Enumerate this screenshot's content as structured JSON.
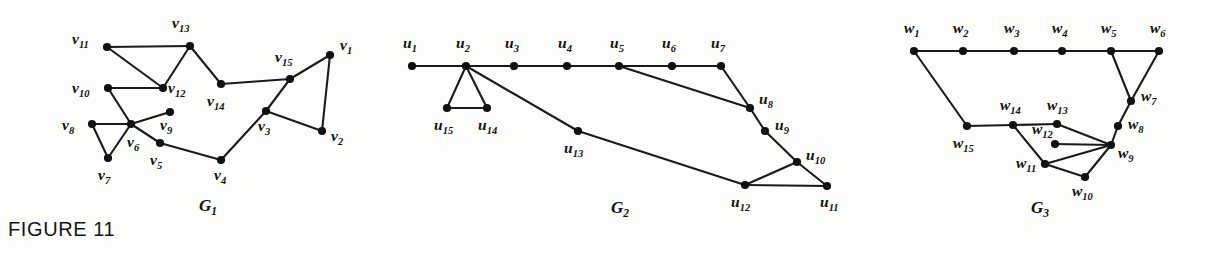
{
  "figure": {
    "caption": "FIGURE 11",
    "background_color": "#fdfdfc",
    "ink_color": "#111111"
  },
  "graphs": [
    {
      "id": "G1",
      "caption_base": "G",
      "caption_sub": "1",
      "caption_x": 208,
      "caption_y": 211,
      "vertex_prefix": "v",
      "vertices": [
        {
          "id": "v1",
          "base": "v",
          "sub": "1",
          "x": 330,
          "y": 55,
          "label_x": 340,
          "label_y": 50
        },
        {
          "id": "v2",
          "base": "v",
          "sub": "2",
          "x": 322,
          "y": 131,
          "label_x": 331,
          "label_y": 141
        },
        {
          "id": "v3",
          "base": "v",
          "sub": "3",
          "x": 266,
          "y": 111,
          "label_x": 258,
          "label_y": 131
        },
        {
          "id": "v4",
          "base": "v",
          "sub": "4",
          "x": 221,
          "y": 160,
          "label_x": 214,
          "label_y": 180
        },
        {
          "id": "v5",
          "base": "v",
          "sub": "5",
          "x": 160,
          "y": 143,
          "label_x": 150,
          "label_y": 165
        },
        {
          "id": "v6",
          "base": "v",
          "sub": "6",
          "x": 131,
          "y": 124,
          "label_x": 127,
          "label_y": 147
        },
        {
          "id": "v7",
          "base": "v",
          "sub": "7",
          "x": 108,
          "y": 158,
          "label_x": 98,
          "label_y": 180
        },
        {
          "id": "v8",
          "base": "v",
          "sub": "8",
          "x": 92,
          "y": 124,
          "label_x": 62,
          "label_y": 130
        },
        {
          "id": "v9",
          "base": "v",
          "sub": "9",
          "x": 170,
          "y": 112,
          "label_x": 160,
          "label_y": 130
        },
        {
          "id": "v10",
          "base": "v",
          "sub": "10",
          "x": 108,
          "y": 88,
          "label_x": 72,
          "label_y": 93
        },
        {
          "id": "v11",
          "base": "v",
          "sub": "11",
          "x": 107,
          "y": 47,
          "label_x": 72,
          "label_y": 44
        },
        {
          "id": "v12",
          "base": "v",
          "sub": "12",
          "x": 163,
          "y": 88,
          "label_x": 168,
          "label_y": 93
        },
        {
          "id": "v13",
          "base": "v",
          "sub": "13",
          "x": 190,
          "y": 46,
          "label_x": 172,
          "label_y": 28
        },
        {
          "id": "v14",
          "base": "v",
          "sub": "14",
          "x": 221,
          "y": 84,
          "label_x": 207,
          "label_y": 106
        },
        {
          "id": "v15",
          "base": "v",
          "sub": "15",
          "x": 290,
          "y": 79,
          "label_x": 275,
          "label_y": 62
        }
      ],
      "edges": [
        [
          "v1",
          "v2"
        ],
        [
          "v1",
          "v15"
        ],
        [
          "v2",
          "v3"
        ],
        [
          "v3",
          "v15"
        ],
        [
          "v3",
          "v4"
        ],
        [
          "v4",
          "v5"
        ],
        [
          "v5",
          "v6"
        ],
        [
          "v6",
          "v7"
        ],
        [
          "v6",
          "v8"
        ],
        [
          "v7",
          "v8"
        ],
        [
          "v6",
          "v9"
        ],
        [
          "v6",
          "v10"
        ],
        [
          "v10",
          "v12"
        ],
        [
          "v11",
          "v12"
        ],
        [
          "v11",
          "v13"
        ],
        [
          "v12",
          "v13"
        ],
        [
          "v13",
          "v14"
        ],
        [
          "v14",
          "v15"
        ]
      ]
    },
    {
      "id": "G2",
      "caption_base": "G",
      "caption_sub": "2",
      "caption_x": 620,
      "caption_y": 213,
      "vertex_prefix": "u",
      "vertices": [
        {
          "id": "u1",
          "base": "u",
          "sub": "1",
          "x": 412,
          "y": 66,
          "label_x": 403,
          "label_y": 48
        },
        {
          "id": "u2",
          "base": "u",
          "sub": "2",
          "x": 466,
          "y": 66,
          "label_x": 456,
          "label_y": 48
        },
        {
          "id": "u3",
          "base": "u",
          "sub": "3",
          "x": 514,
          "y": 66,
          "label_x": 505,
          "label_y": 48
        },
        {
          "id": "u4",
          "base": "u",
          "sub": "4",
          "x": 567,
          "y": 66,
          "label_x": 558,
          "label_y": 48
        },
        {
          "id": "u5",
          "base": "u",
          "sub": "5",
          "x": 619,
          "y": 66,
          "label_x": 610,
          "label_y": 48
        },
        {
          "id": "u6",
          "base": "u",
          "sub": "6",
          "x": 672,
          "y": 66,
          "label_x": 662,
          "label_y": 48
        },
        {
          "id": "u7",
          "base": "u",
          "sub": "7",
          "x": 721,
          "y": 66,
          "label_x": 711,
          "label_y": 48
        },
        {
          "id": "u8",
          "base": "u",
          "sub": "8",
          "x": 750,
          "y": 108,
          "label_x": 759,
          "label_y": 104
        },
        {
          "id": "u9",
          "base": "u",
          "sub": "9",
          "x": 765,
          "y": 131,
          "label_x": 775,
          "label_y": 130
        },
        {
          "id": "u10",
          "base": "u",
          "sub": "10",
          "x": 797,
          "y": 162,
          "label_x": 806,
          "label_y": 160
        },
        {
          "id": "u11",
          "base": "u",
          "sub": "11",
          "x": 827,
          "y": 186,
          "label_x": 820,
          "label_y": 207
        },
        {
          "id": "u12",
          "base": "u",
          "sub": "12",
          "x": 745,
          "y": 185,
          "label_x": 731,
          "label_y": 207
        },
        {
          "id": "u13",
          "base": "u",
          "sub": "13",
          "x": 578,
          "y": 131,
          "label_x": 564,
          "label_y": 153
        },
        {
          "id": "u14",
          "base": "u",
          "sub": "14",
          "x": 487,
          "y": 108,
          "label_x": 478,
          "label_y": 130
        },
        {
          "id": "u15",
          "base": "u",
          "sub": "15",
          "x": 447,
          "y": 108,
          "label_x": 434,
          "label_y": 130
        }
      ],
      "edges": [
        [
          "u1",
          "u2"
        ],
        [
          "u2",
          "u3"
        ],
        [
          "u3",
          "u4"
        ],
        [
          "u4",
          "u5"
        ],
        [
          "u5",
          "u6"
        ],
        [
          "u6",
          "u7"
        ],
        [
          "u7",
          "u8"
        ],
        [
          "u5",
          "u8"
        ],
        [
          "u8",
          "u9"
        ],
        [
          "u9",
          "u10"
        ],
        [
          "u10",
          "u11"
        ],
        [
          "u10",
          "u12"
        ],
        [
          "u11",
          "u12"
        ],
        [
          "u2",
          "u13"
        ],
        [
          "u13",
          "u12"
        ],
        [
          "u2",
          "u14"
        ],
        [
          "u2",
          "u15"
        ],
        [
          "u14",
          "u15"
        ]
      ]
    },
    {
      "id": "G3",
      "caption_base": "G",
      "caption_sub": "3",
      "caption_x": 1040,
      "caption_y": 213,
      "vertex_prefix": "w",
      "vertices": [
        {
          "id": "w1",
          "base": "w",
          "sub": "1",
          "x": 914,
          "y": 51,
          "label_x": 904,
          "label_y": 33
        },
        {
          "id": "w2",
          "base": "w",
          "sub": "2",
          "x": 963,
          "y": 51,
          "label_x": 953,
          "label_y": 33
        },
        {
          "id": "w3",
          "base": "w",
          "sub": "3",
          "x": 1014,
          "y": 51,
          "label_x": 1004,
          "label_y": 33
        },
        {
          "id": "w4",
          "base": "w",
          "sub": "4",
          "x": 1062,
          "y": 51,
          "label_x": 1052,
          "label_y": 33
        },
        {
          "id": "w5",
          "base": "w",
          "sub": "5",
          "x": 1111,
          "y": 51,
          "label_x": 1101,
          "label_y": 33
        },
        {
          "id": "w6",
          "base": "w",
          "sub": "6",
          "x": 1159,
          "y": 51,
          "label_x": 1150,
          "label_y": 33
        },
        {
          "id": "w7",
          "base": "w",
          "sub": "7",
          "x": 1131,
          "y": 101,
          "label_x": 1141,
          "label_y": 101
        },
        {
          "id": "w8",
          "base": "w",
          "sub": "8",
          "x": 1118,
          "y": 126,
          "label_x": 1128,
          "label_y": 129
        },
        {
          "id": "w9",
          "base": "w",
          "sub": "9",
          "x": 1111,
          "y": 145,
          "label_x": 1118,
          "label_y": 158
        },
        {
          "id": "w10",
          "base": "w",
          "sub": "10",
          "x": 1085,
          "y": 177,
          "label_x": 1072,
          "label_y": 196
        },
        {
          "id": "w11",
          "base": "w",
          "sub": "11",
          "x": 1045,
          "y": 164,
          "label_x": 1016,
          "label_y": 168
        },
        {
          "id": "w12",
          "base": "w",
          "sub": "12",
          "x": 1055,
          "y": 144,
          "label_x": 1032,
          "label_y": 134
        },
        {
          "id": "w13",
          "base": "w",
          "sub": "13",
          "x": 1057,
          "y": 124,
          "label_x": 1047,
          "label_y": 110
        },
        {
          "id": "w14",
          "base": "w",
          "sub": "14",
          "x": 1013,
          "y": 125,
          "label_x": 1000,
          "label_y": 110
        },
        {
          "id": "w15",
          "base": "w",
          "sub": "15",
          "x": 967,
          "y": 126,
          "label_x": 953,
          "label_y": 148
        }
      ],
      "edges": [
        [
          "w1",
          "w2"
        ],
        [
          "w2",
          "w3"
        ],
        [
          "w3",
          "w4"
        ],
        [
          "w4",
          "w5"
        ],
        [
          "w5",
          "w6"
        ],
        [
          "w5",
          "w7"
        ],
        [
          "w6",
          "w7"
        ],
        [
          "w7",
          "w8"
        ],
        [
          "w8",
          "w9"
        ],
        [
          "w1",
          "w15"
        ],
        [
          "w15",
          "w14"
        ],
        [
          "w14",
          "w13"
        ],
        [
          "w14",
          "w11"
        ],
        [
          "w13",
          "w9"
        ],
        [
          "w12",
          "w9"
        ],
        [
          "w11",
          "w9"
        ],
        [
          "w10",
          "w9"
        ],
        [
          "w11",
          "w10"
        ]
      ]
    }
  ]
}
